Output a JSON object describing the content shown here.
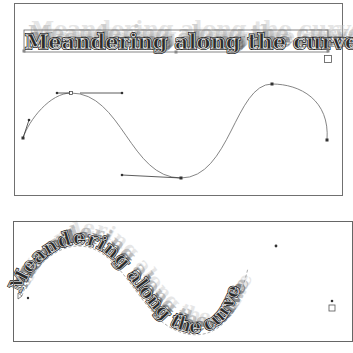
{
  "top_panel": {
    "text": "Meandering along the curve",
    "description": "Straight text with shadow streak effect inside text frame; bezier path below"
  },
  "bottom_panel": {
    "text": "Meandering along the curve",
    "description": "Text on S-shaped path with shadow streak effect"
  },
  "colors": {
    "frame": "#6a6a6a",
    "text_fill": "#2b2b2b",
    "text_outline": "#111111",
    "text_inner_stroke": "#ffffff",
    "shadow_dark": "#3a3a3a",
    "shadow_light": "#ffffff",
    "path": "#707070",
    "handle": "#333333"
  },
  "icons": {
    "overflow_port": "square-outline",
    "in_port": "triangle-outline"
  }
}
